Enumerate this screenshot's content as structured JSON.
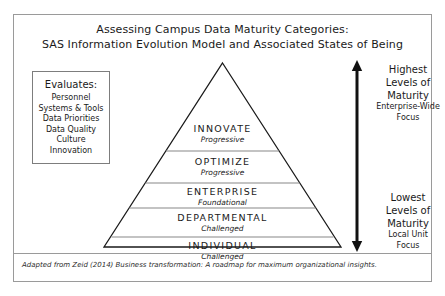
{
  "figure": {
    "title_lines": [
      "Assessing Campus Data Maturity Categories:",
      "SAS Information Evolution Model and Associated States of Being"
    ],
    "footer_note": "Adapted from Zeid (2014) Business transformation: A roadmap for maximum organizational insights."
  },
  "evaluates_panel": {
    "heading": "Evaluates:",
    "items": [
      "Personnel",
      "Systems & Tools",
      "Data Priorities",
      "Data Quality",
      "Culture",
      "Innovation"
    ]
  },
  "pyramid": {
    "tiers": [
      {
        "name": "INNOVATE",
        "state": "Progressive"
      },
      {
        "name": "OPTIMIZE",
        "state": "Progressive"
      },
      {
        "name": "ENTERPRISE",
        "state": "Foundational"
      },
      {
        "name": "DEPARTMENTAL",
        "state": "Challenged"
      },
      {
        "name": "INDIVIDUAL",
        "state": "Challenged"
      }
    ]
  },
  "maturity_axis": {
    "arrow_name": "double-headed-vertical-arrow",
    "top": {
      "title_lines": [
        "Highest",
        "Levels of",
        "Maturity"
      ],
      "sub_lines": [
        "Enterprise-Wide",
        "Focus"
      ]
    },
    "bottom": {
      "title_lines": [
        "Lowest",
        "Levels of",
        "Maturity"
      ],
      "sub_lines": [
        "Local Unit",
        "Focus"
      ]
    }
  },
  "colors": {
    "frame_border": "#9a9a9a",
    "pyramid_outline": "#1a1a1a",
    "tier_divider": "#888888",
    "text": "#1a1a1a",
    "background": "#ffffff"
  }
}
